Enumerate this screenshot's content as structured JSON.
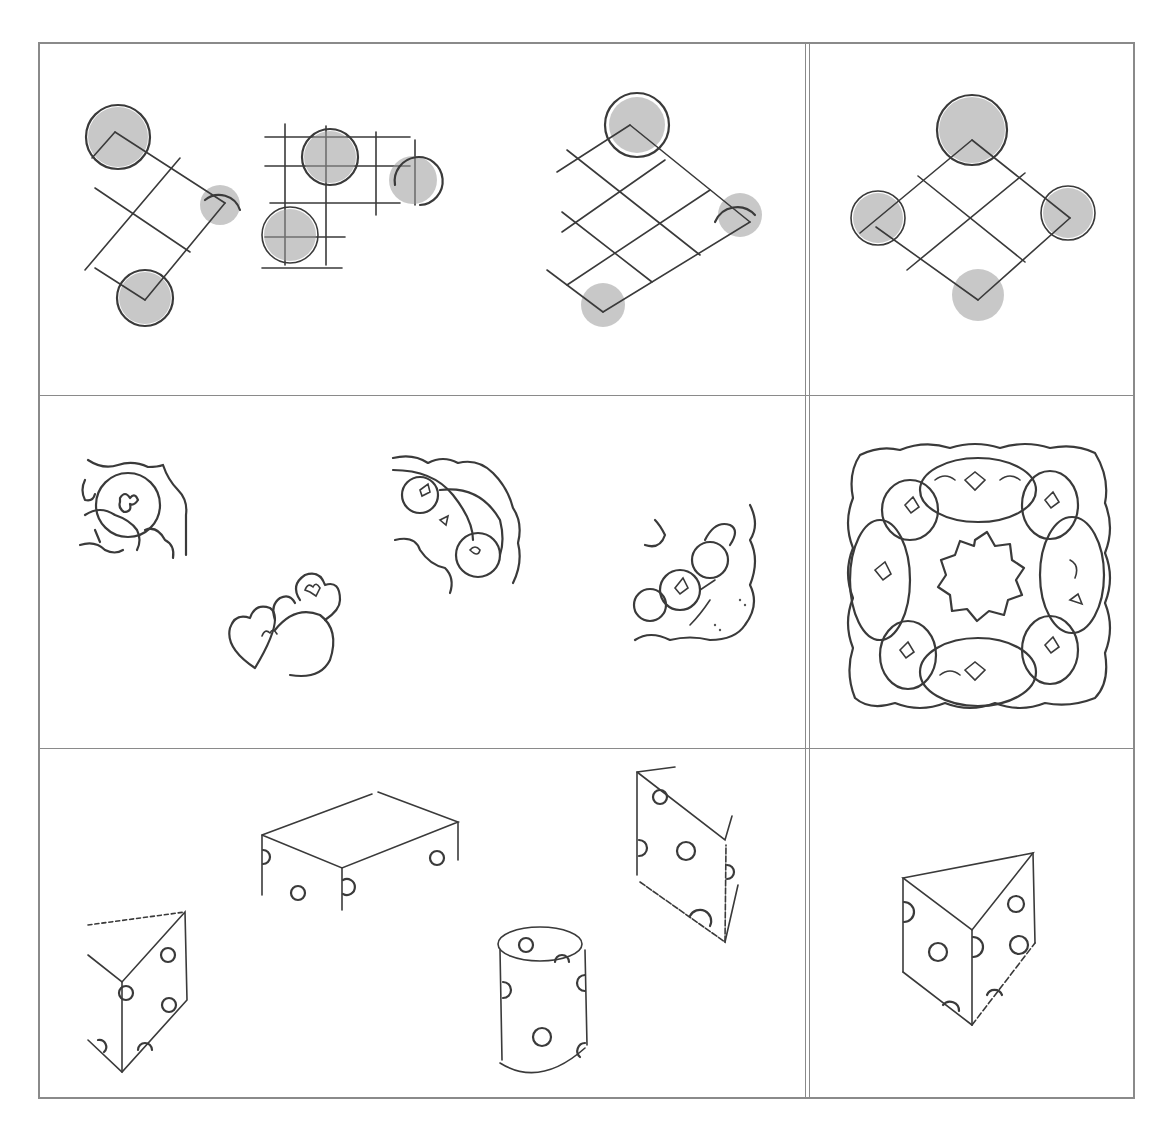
{
  "figure": {
    "layout": {
      "rows": 3,
      "columns": [
        "options",
        "target"
      ],
      "divider_style": "double-vertical"
    },
    "rows": [
      {
        "name": "grid-with-circles",
        "options": [
          "rotated grid with three shaded circles",
          "square grid with three shaded circles",
          "diamond grid with three circles"
        ],
        "target": "diamond grid with four shaded circles"
      },
      {
        "name": "ornament-pieces",
        "options": [
          "ornament corner fragment",
          "heart scroll fragment",
          "scalloped quarter fragment",
          "floral quarter fragment"
        ],
        "target": "complete scalloped square ornament with floral ring"
      },
      {
        "name": "dotted-solids",
        "options": [
          "triangular prism fragment",
          "open rectangular box",
          "cylinder with dots",
          "folded dotted panel"
        ],
        "target": "dotted triangular prism"
      }
    ],
    "caption": ""
  },
  "colors": {
    "ink": "#3a3a3a",
    "border": "#8a8a8a",
    "shade": "#9a9a9a",
    "background": "#ffffff"
  }
}
